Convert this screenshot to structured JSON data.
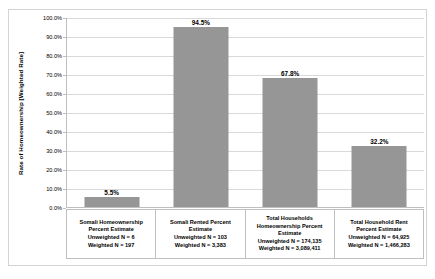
{
  "chart_data": {
    "type": "bar",
    "title": "",
    "xlabel": "",
    "ylabel": "Rate of Homeownership [Weighted Rate]",
    "ylim": [
      0,
      100
    ],
    "grid": true,
    "legend": false,
    "bar_color": "#969696",
    "gridline_color": "#d9d9d9",
    "axis_color": "#bfbfbf",
    "categories": [
      "Somali Homeownership Percent Estimate",
      "Somali Rented Percent Estimate",
      "Total Households Homeownership Percent Estimate",
      "Total Household Rent Percent Estimate"
    ],
    "values": [
      5.5,
      94.5,
      67.8,
      32.2
    ],
    "data_labels": [
      "5.5%",
      "94.5%",
      "67.8%",
      "32.2%"
    ],
    "ytick_labels": [
      "100.0%",
      "90.0%",
      "80.0%",
      "70.0%",
      "60.0%",
      "50.0%",
      "40.0%",
      "30.0%",
      "20.0%",
      "10.0%",
      "0.0%"
    ],
    "ytick_values": [
      100,
      90,
      80,
      70,
      60,
      50,
      40,
      30,
      20,
      10,
      0
    ],
    "category_details": [
      {
        "name_lines": [
          "Somali Homeownership",
          "Percent Estimate"
        ],
        "unweighted": "Unweighted N = 6",
        "weighted": "Weighted N = 197"
      },
      {
        "name_lines": [
          "Somali Rented Percent",
          "Estimate"
        ],
        "unweighted": "Unweighted N = 103",
        "weighted": "Weighted N = 3,383"
      },
      {
        "name_lines": [
          "Total Households",
          "Homeownership Percent",
          "Estimate"
        ],
        "unweighted": "Unweighted N = 174,135",
        "weighted": "Weighted N = 3,089,411"
      },
      {
        "name_lines": [
          "Total Household Rent",
          "Percent Estimate"
        ],
        "unweighted": "Unweighted N = 64,925",
        "weighted": "Weighted N = 1,466,283"
      }
    ]
  }
}
